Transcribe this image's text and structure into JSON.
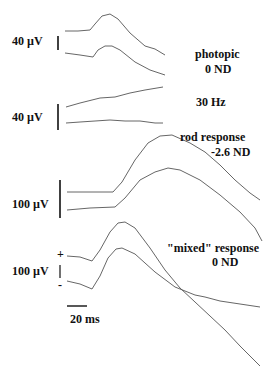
{
  "chart_data": {
    "type": "line",
    "title": "",
    "xlabel": "",
    "ylabel": "",
    "scale_bars": {
      "time": "20 ms",
      "photopic_amplitude": "40 µV",
      "flicker_amplitude": "40 µV",
      "rod_amplitude": "100 µV",
      "mixed_amplitude": "100 µV"
    },
    "polarity_markers": {
      "plus": "+",
      "minus": "-"
    },
    "panels": [
      {
        "name": "photopic",
        "label_line1": "photopic",
        "label_line2": "0 ND",
        "scale": "40 µV",
        "series": [
          {
            "name": "trace-1",
            "points": [
              [
                65,
                31
              ],
              [
                78,
                31
              ],
              [
                90,
                30
              ],
              [
                95,
                24
              ],
              [
                102,
                16
              ],
              [
                110,
                14
              ],
              [
                118,
                19
              ],
              [
                130,
                33
              ],
              [
                145,
                46
              ],
              [
                155,
                49
              ],
              [
                165,
                55
              ]
            ]
          },
          {
            "name": "trace-2",
            "points": [
              [
                65,
                53
              ],
              [
                80,
                55
              ],
              [
                93,
                57
              ],
              [
                98,
                50
              ],
              [
                105,
                46
              ],
              [
                112,
                46
              ],
              [
                120,
                50
              ],
              [
                135,
                62
              ],
              [
                150,
                70
              ],
              [
                165,
                75
              ]
            ]
          }
        ]
      },
      {
        "name": "flicker",
        "label_line1": "30 Hz",
        "scale": "40 µV",
        "series": [
          {
            "name": "trace-1",
            "points": [
              [
                66,
                107
              ],
              [
                80,
                103
              ],
              [
                100,
                98
              ],
              [
                115,
                97
              ],
              [
                130,
                93
              ],
              [
                145,
                90
              ],
              [
                163,
                87
              ]
            ]
          },
          {
            "name": "trace-2",
            "points": [
              [
                66,
                123
              ],
              [
                80,
                122
              ],
              [
                95,
                121
              ],
              [
                110,
                120
              ],
              [
                125,
                121
              ],
              [
                140,
                121
              ],
              [
                155,
                123
              ],
              [
                163,
                123
              ]
            ]
          }
        ]
      },
      {
        "name": "rod",
        "label_line1": "rod response",
        "label_line2": "-2.6 ND",
        "scale": "100 µV",
        "series": [
          {
            "name": "trace-1",
            "points": [
              [
                67,
                192
              ],
              [
                90,
                192
              ],
              [
                113,
                192
              ],
              [
                122,
                182
              ],
              [
                135,
                160
              ],
              [
                148,
                143
              ],
              [
                160,
                136
              ],
              [
                172,
                135
              ],
              [
                190,
                143
              ],
              [
                205,
                152
              ],
              [
                220,
                165
              ],
              [
                235,
                180
              ],
              [
                250,
                193
              ],
              [
                260,
                200
              ]
            ]
          },
          {
            "name": "trace-2",
            "points": [
              [
                67,
                210
              ],
              [
                90,
                208
              ],
              [
                115,
                207
              ],
              [
                125,
                198
              ],
              [
                140,
                180
              ],
              [
                155,
                172
              ],
              [
                168,
                168
              ],
              [
                180,
                170
              ],
              [
                200,
                180
              ],
              [
                220,
                195
              ],
              [
                240,
                212
              ],
              [
                255,
                228
              ],
              [
                262,
                241
              ]
            ]
          }
        ]
      },
      {
        "name": "mixed",
        "label_line1": "\"mixed\" response",
        "label_line2": "0 ND",
        "scale": "100 µV",
        "series": [
          {
            "name": "trace-1",
            "points": [
              [
                67,
                256
              ],
              [
                80,
                257
              ],
              [
                92,
                261
              ],
              [
                100,
                250
              ],
              [
                110,
                232
              ],
              [
                118,
                223
              ],
              [
                125,
                222
              ],
              [
                135,
                228
              ],
              [
                150,
                248
              ],
              [
                165,
                270
              ],
              [
                180,
                288
              ],
              [
                195,
                302
              ],
              [
                210,
                316
              ],
              [
                225,
                330
              ],
              [
                240,
                346
              ],
              [
                260,
                366
              ]
            ]
          },
          {
            "name": "trace-2",
            "points": [
              [
                67,
                281
              ],
              [
                80,
                284
              ],
              [
                92,
                289
              ],
              [
                100,
                276
              ],
              [
                108,
                258
              ],
              [
                116,
                249
              ],
              [
                122,
                248
              ],
              [
                135,
                254
              ],
              [
                155,
                272
              ],
              [
                175,
                287
              ],
              [
                195,
                295
              ],
              [
                205,
                297
              ],
              [
                220,
                301
              ],
              [
                240,
                304
              ],
              [
                260,
                307
              ]
            ]
          }
        ]
      }
    ]
  }
}
